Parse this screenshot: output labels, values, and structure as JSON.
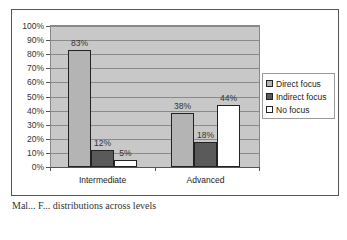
{
  "chart_data": {
    "type": "bar",
    "title": "",
    "xlabel": "",
    "ylabel": "",
    "categories": [
      "Intermediate",
      "Advanced"
    ],
    "series": [
      {
        "name": "Direct focus",
        "values": [
          83,
          38
        ],
        "color": "#b4b4b4"
      },
      {
        "name": "Indirect focus",
        "values": [
          12,
          18
        ],
        "color": "#5a5a5a"
      },
      {
        "name": "No focus",
        "values": [
          5,
          44
        ],
        "color": "#ffffff"
      }
    ],
    "value_labels": [
      [
        "83%",
        "38%"
      ],
      [
        "12%",
        "18%"
      ],
      [
        "5%",
        "44%"
      ]
    ],
    "ylim": [
      0,
      100
    ],
    "yticks": [
      "0%",
      "10%",
      "20%",
      "30%",
      "40%",
      "50%",
      "60%",
      "70%",
      "80%",
      "90%",
      "100%"
    ],
    "grid": true,
    "legend_position": "right",
    "plot_background": "#c8c8c8"
  },
  "legend": {
    "items": [
      "Direct focus",
      "Indirect focus",
      "No focus"
    ]
  },
  "caption": "Mal... F... distributions across levels"
}
